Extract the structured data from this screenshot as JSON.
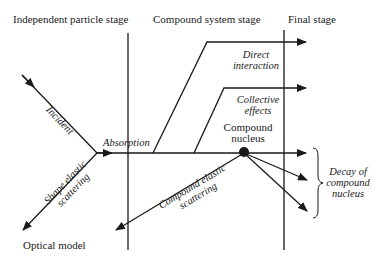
{
  "stages": {
    "independent": "Independent particle stage",
    "compound": "Compound system stage",
    "final": "Final stage"
  },
  "labels": {
    "incident": "Incident",
    "absorption": "Absorption",
    "direct_interaction_1": "Direct",
    "direct_interaction_2": "interaction",
    "collective_1": "Collective",
    "collective_2": "effects",
    "compound_nucleus_1": "Compound",
    "compound_nucleus_2": "nucleus",
    "shape_elastic_1": "Shape elastic",
    "shape_elastic_2": "scattering",
    "compound_elastic_1": "Compound elastic",
    "compound_elastic_2": "scattering",
    "decay_1": "Decay of",
    "decay_2": "compound",
    "decay_3": "nucleus",
    "optical_model": "Optical model"
  },
  "colors": {
    "ink": "#1a1a1a",
    "background": "#ffffff"
  }
}
